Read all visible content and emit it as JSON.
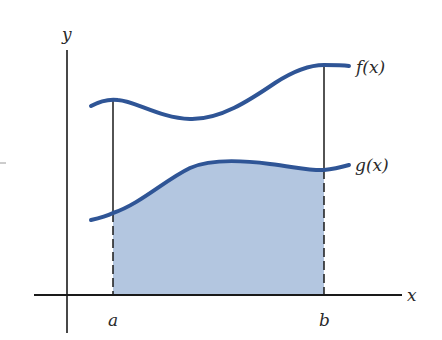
{
  "figure": {
    "colors": {
      "curve": "#2f5596",
      "fill": "#b3c6e0",
      "axis": "#1a1a1a",
      "label": "#2a2a2a"
    },
    "axes": {
      "x_label": "x",
      "y_label": "y"
    },
    "bounds": {
      "a_label": "a",
      "b_label": "b"
    },
    "curves": [
      {
        "name": "f",
        "label": "f(x)"
      },
      {
        "name": "g",
        "label": "g(x)"
      }
    ],
    "shaded_region": "area under g(x) from a to b"
  }
}
